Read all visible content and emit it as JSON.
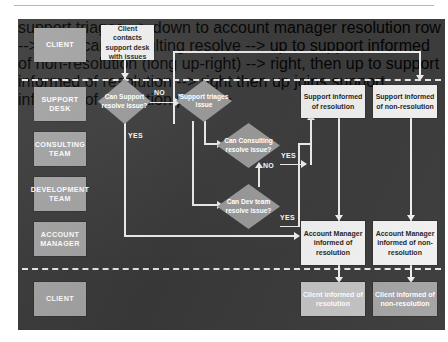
{
  "diagram": {
    "colors": {
      "panel_background": "#3a3a3a",
      "role_box": "#a3a3a3",
      "process_box": "#f2f2f2",
      "decision": "#9b9b9b",
      "connector": "#f0f0f0",
      "lane_divider": "#e8e8e8"
    },
    "lanes": [
      {
        "id": "client-top",
        "label": "CLIENT"
      },
      {
        "id": "support-desk",
        "label": "SUPPORT\nDESK"
      },
      {
        "id": "consulting-team",
        "label": "CONSULTING\nTEAM"
      },
      {
        "id": "development-team",
        "label": "DEVELOPMENT\nTEAM"
      },
      {
        "id": "account-manager",
        "label": "ACCOUNT\nMANAGER"
      },
      {
        "id": "client-bottom",
        "label": "CLIENT"
      }
    ],
    "processes": [
      {
        "id": "client-contacts",
        "label": "Client contacts support desk with issues"
      },
      {
        "id": "support-informed-resolution",
        "label": "Support informed of resolution"
      },
      {
        "id": "support-informed-non-resolution",
        "label": "Support informed of non-resolution"
      },
      {
        "id": "am-informed-resolution",
        "label": "Account Manager informed of resolution"
      },
      {
        "id": "am-informed-non-resolution",
        "label": "Account Manager informed of non-resolution"
      },
      {
        "id": "client-informed-resolution",
        "label": "Client informed of resolution"
      },
      {
        "id": "client-informed-non-resolution",
        "label": "Client informed of non-resolution"
      }
    ],
    "decisions": [
      {
        "id": "can-support-resolve",
        "label": "Can Support resolve issue?"
      },
      {
        "id": "support-triages",
        "label": "Support triages issue"
      },
      {
        "id": "can-consulting-resolve",
        "label": "Can Consulting resolve issue?"
      },
      {
        "id": "can-dev-resolve",
        "label": "Can Dev team resolve issue?"
      }
    ],
    "edge_labels": {
      "support_no": "NO",
      "support_yes": "YES",
      "consulting_no": "NO",
      "consulting_yes": "YES",
      "dev_no": "NO",
      "dev_yes": "YES"
    }
  }
}
